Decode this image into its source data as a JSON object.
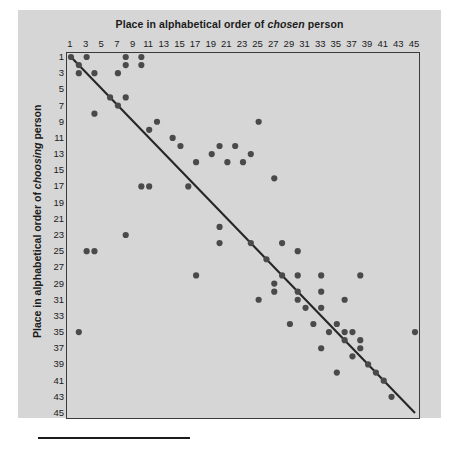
{
  "figure": {
    "title_prefix": "Place in alphabetical order of ",
    "title_emphasis": "chosen",
    "title_suffix": " person",
    "y_axis_prefix": "Place in alphabetical order of ",
    "y_axis_emphasis": "choosing",
    "y_axis_suffix": " person",
    "panel_color": "#d6d6d6",
    "dot_color": "#4a4a4a",
    "line_color": "#262626"
  },
  "chart_data": {
    "type": "scatter",
    "title": "Place in alphabetical order of chosen person",
    "xlabel": "Place in alphabetical order of chosen person",
    "ylabel": "Place in alphabetical order of choosing person",
    "xlim": [
      1,
      45
    ],
    "ylim": [
      1,
      45
    ],
    "y_inverted": true,
    "grid": false,
    "legend": null,
    "xticks": [
      1,
      3,
      5,
      7,
      9,
      11,
      13,
      15,
      17,
      19,
      21,
      23,
      25,
      27,
      29,
      31,
      33,
      35,
      37,
      39,
      41,
      43,
      45
    ],
    "yticks": [
      1,
      3,
      5,
      7,
      9,
      11,
      13,
      15,
      17,
      19,
      21,
      23,
      25,
      27,
      29,
      31,
      33,
      35,
      37,
      39,
      41,
      43,
      45
    ],
    "trend_line": {
      "x": [
        1,
        45
      ],
      "y": [
        1,
        45
      ]
    },
    "points": [
      [
        1,
        1
      ],
      [
        2,
        2
      ],
      [
        3,
        1
      ],
      [
        8,
        1
      ],
      [
        10,
        1
      ],
      [
        8,
        2
      ],
      [
        10,
        2
      ],
      [
        2,
        3
      ],
      [
        4,
        3
      ],
      [
        7,
        3
      ],
      [
        6,
        6
      ],
      [
        8,
        6
      ],
      [
        7,
        7
      ],
      [
        4,
        8
      ],
      [
        12,
        9
      ],
      [
        25,
        9
      ],
      [
        11,
        10
      ],
      [
        14,
        11
      ],
      [
        15,
        12
      ],
      [
        20,
        12
      ],
      [
        22,
        12
      ],
      [
        19,
        13
      ],
      [
        24,
        13
      ],
      [
        21,
        14
      ],
      [
        23,
        14
      ],
      [
        17,
        14
      ],
      [
        10,
        17
      ],
      [
        16,
        17
      ],
      [
        11,
        17
      ],
      [
        27,
        16
      ],
      [
        8,
        23
      ],
      [
        3,
        25
      ],
      [
        4,
        25
      ],
      [
        20,
        22
      ],
      [
        20,
        24
      ],
      [
        24,
        24
      ],
      [
        28,
        24
      ],
      [
        30,
        25
      ],
      [
        26,
        26
      ],
      [
        2,
        35
      ],
      [
        17,
        28
      ],
      [
        28,
        28
      ],
      [
        30,
        28
      ],
      [
        33,
        28
      ],
      [
        38,
        28
      ],
      [
        27,
        29
      ],
      [
        27,
        30
      ],
      [
        30,
        30
      ],
      [
        33,
        30
      ],
      [
        30,
        31
      ],
      [
        25,
        31
      ],
      [
        31,
        32
      ],
      [
        33,
        32
      ],
      [
        36,
        31
      ],
      [
        45,
        35
      ],
      [
        29,
        34
      ],
      [
        32,
        34
      ],
      [
        35,
        34
      ],
      [
        34,
        35
      ],
      [
        36,
        35
      ],
      [
        37,
        35
      ],
      [
        38,
        36
      ],
      [
        36,
        36
      ],
      [
        33,
        37
      ],
      [
        38,
        37
      ],
      [
        37,
        38
      ],
      [
        35,
        40
      ],
      [
        39,
        39
      ],
      [
        40,
        40
      ],
      [
        41,
        41
      ],
      [
        42,
        43
      ]
    ]
  }
}
